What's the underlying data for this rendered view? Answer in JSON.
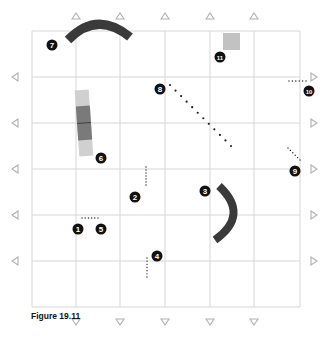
{
  "figure": {
    "caption": "Figure 19.11",
    "grid": {
      "left": 32,
      "top": 31,
      "right": 300,
      "bottom": 307,
      "columns": [
        32,
        76,
        120,
        165,
        210,
        254,
        300
      ],
      "rows": [
        31,
        77,
        123,
        169,
        215,
        261,
        307
      ],
      "line_color": "#d6d6d6"
    },
    "edge_markers": {
      "top_x": [
        76,
        120,
        165,
        210,
        254
      ],
      "bottom_x": [
        76,
        120,
        165,
        210,
        254
      ],
      "left_y": [
        77,
        123,
        169,
        215,
        261
      ],
      "right_y": [
        77,
        123,
        169,
        215,
        261
      ],
      "color": "#b0b0b0"
    },
    "colors": {
      "dark_shape": "#3a3a3a",
      "light_shape": "#c8c8c8",
      "mid_shape": "#8a8a8a",
      "badge_fill": "#111111",
      "badge_text": "#ffffff",
      "dots": "#222222"
    },
    "callouts": [
      {
        "n": "1",
        "x": 78,
        "y": 229
      },
      {
        "n": "2",
        "x": 135,
        "y": 197
      },
      {
        "n": "3",
        "x": 205,
        "y": 191
      },
      {
        "n": "4",
        "x": 157,
        "y": 256
      },
      {
        "n": "5",
        "x": 101,
        "y": 229
      },
      {
        "n": "6",
        "x": 101,
        "y": 158
      },
      {
        "n": "7",
        "x": 52,
        "y": 45
      },
      {
        "n": "8",
        "x": 160,
        "y": 89
      },
      {
        "n": "9",
        "x": 295,
        "y": 171
      },
      {
        "n": "10",
        "x": 309,
        "y": 91
      },
      {
        "n": "11",
        "x": 220,
        "y": 57
      }
    ]
  }
}
